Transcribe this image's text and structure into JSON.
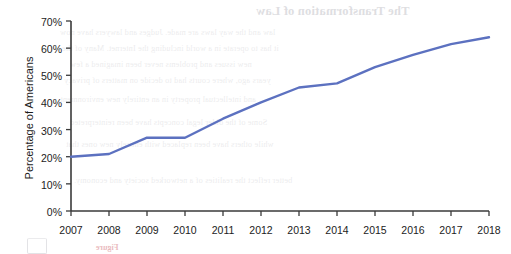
{
  "chart_data": {
    "type": "line",
    "title": "",
    "xlabel": "",
    "ylabel": "Percentage of Americans",
    "categories": [
      "2007",
      "2008",
      "2009",
      "2010",
      "2011",
      "2012",
      "2013",
      "2014",
      "2015",
      "2016",
      "2017",
      "2018"
    ],
    "x": [
      2007,
      2008,
      2009,
      2010,
      2011,
      2012,
      2013,
      2014,
      2015,
      2016,
      2017,
      2018
    ],
    "series": [
      {
        "name": "Percentage of Americans",
        "values": [
          20,
          21,
          27,
          27,
          34,
          40,
          45.5,
          47,
          53,
          57.5,
          61.5,
          64
        ]
      }
    ],
    "values": [
      20,
      21,
      27,
      27,
      34,
      40,
      45.5,
      47,
      53,
      57.5,
      61.5,
      64
    ],
    "ylim": [
      0,
      70
    ],
    "xlim": [
      2007,
      2018
    ],
    "ytick_labels": [
      "0%",
      "10%",
      "20%",
      "30%",
      "40%",
      "50%",
      "60%",
      "70%"
    ],
    "ytick_values": [
      0,
      10,
      20,
      30,
      40,
      50,
      60,
      70
    ],
    "xtick_labels": [
      "2007",
      "2008",
      "2009",
      "2010",
      "2011",
      "2012",
      "2013",
      "2014",
      "2015",
      "2016",
      "2017",
      "2018"
    ],
    "grid": false,
    "legend": "none",
    "line_color": "#5c71c0",
    "axis_color": "#3a3a3a"
  },
  "axes": {
    "y_label": "Percentage of Americans",
    "y_ticks": [
      "70%",
      "60%",
      "50%",
      "40%",
      "30%",
      "20%",
      "10%",
      "0%"
    ],
    "x_ticks": [
      "2007",
      "2008",
      "2009",
      "2010",
      "2011",
      "2012",
      "2013",
      "2014",
      "2015",
      "2016",
      "2017",
      "2018"
    ]
  },
  "background_text": {
    "heading": "The Transformation of Law",
    "lines": [
      "law and the way laws are made. Judges and lawyers have now",
      "it has to operate in a world including the Internet. Many of the",
      "new issues and problems never been imagined a few",
      "years ago, where courts had to decide on matters of privacy",
      "and intellectual property in an entirely new environment.",
      "Some of the older legal concepts have been reinterpreted",
      "while others have been replaced with entirely new ones that",
      "better reflect the realities of a networked society and economy."
    ],
    "footer_note": "Figure"
  }
}
